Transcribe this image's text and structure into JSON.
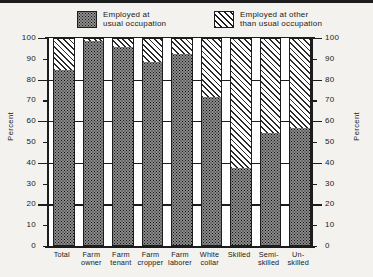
{
  "legend": {
    "items": [
      {
        "name": "usual-occupation",
        "label": "Employed at\nusual occupation",
        "pattern": "dots"
      },
      {
        "name": "other-occupation",
        "label": "Employed at other\nthan usual occupation",
        "pattern": "hatch"
      }
    ]
  },
  "chart_data": {
    "type": "bar",
    "subtype": "stacked-100-percent",
    "title": "",
    "xlabel": "",
    "ylabel": "Percent",
    "ylabel_right": "Percent",
    "ylim": [
      0,
      100
    ],
    "yticks": [
      0,
      10,
      20,
      30,
      40,
      50,
      60,
      70,
      80,
      90,
      100
    ],
    "ytick_labels": [
      "0",
      "10",
      "20",
      "30",
      "40",
      "50",
      "60",
      "70",
      "80",
      "90",
      "100"
    ],
    "gridlines": [
      20,
      40,
      60,
      80,
      100
    ],
    "grid": true,
    "legend_position": "top",
    "categories": [
      "Total",
      "Farm\nowner",
      "Farm\ntenant",
      "Farm\ncropper",
      "Farm\nlaborer",
      "White\ncollar",
      "Skilled",
      "Semi-\nskilled",
      "Un-\nskilled"
    ],
    "series": [
      {
        "name": "Employed at usual occupation",
        "pattern": "dots",
        "values": [
          85,
          99,
          96,
          89,
          93,
          72,
          38,
          55,
          57
        ]
      },
      {
        "name": "Employed at other than usual occupation",
        "pattern": "hatch",
        "values": [
          15,
          1,
          4,
          11,
          7,
          28,
          62,
          45,
          43
        ]
      }
    ]
  },
  "colors": {
    "ink": "#1d1d1d",
    "paper": "#f3f2ef",
    "plot_background": "#ffffff",
    "dots_fill": "#8b8b8b",
    "hatch_fill": "#ffffff"
  }
}
